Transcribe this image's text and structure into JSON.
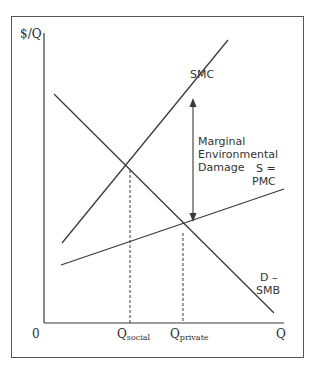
{
  "diagram": {
    "axes": {
      "y_label": "$/Q",
      "x_label": "Q",
      "origin_label": "0"
    },
    "curves": {
      "smc": {
        "label": "SMC"
      },
      "pmc": {
        "label_line1": "S =",
        "label_line2": "PMC"
      },
      "demand": {
        "label_line1": "D –",
        "label_line2": "SMB"
      }
    },
    "annotation": {
      "line1": "Marginal",
      "line2": "Environmental",
      "line3": "Damage"
    },
    "quantities": {
      "social": {
        "main": "Q",
        "sub": "social"
      },
      "private": {
        "main": "Q",
        "sub": "private"
      }
    },
    "colors": {
      "line": "#3a3a3a",
      "frame": "#555555",
      "background": "#ffffff"
    }
  }
}
